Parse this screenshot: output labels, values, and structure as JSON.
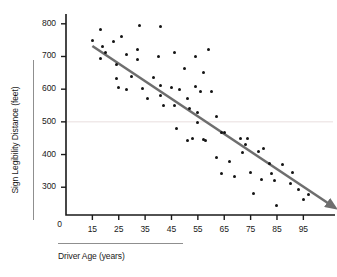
{
  "chart_data": {
    "type": "scatter",
    "title": "",
    "xlabel": "Driver Age (years)",
    "ylabel": "Sign Legibility Distance (feet)",
    "xlim": [
      5,
      107
    ],
    "ylim": [
      215,
      830
    ],
    "xticks": [
      15,
      25,
      35,
      45,
      55,
      65,
      75,
      85,
      95
    ],
    "yticks": [
      300,
      400,
      500,
      600,
      700,
      800
    ],
    "origin_label": "0",
    "grid": "single faint horizontal gridline at y=500",
    "gridline_value": 500,
    "legend": "none",
    "series": [
      {
        "name": "drivers",
        "marker": "filled circle",
        "color": "#141414",
        "points": [
          [
            15,
            750
          ],
          [
            18,
            782
          ],
          [
            18,
            695
          ],
          [
            19,
            730
          ],
          [
            20,
            712
          ],
          [
            23,
            745
          ],
          [
            24,
            675
          ],
          [
            24,
            632
          ],
          [
            25,
            604
          ],
          [
            26,
            762
          ],
          [
            28,
            705
          ],
          [
            30,
            640
          ],
          [
            32,
            722
          ],
          [
            32,
            691
          ],
          [
            33,
            795
          ],
          [
            36,
            570
          ],
          [
            38,
            635
          ],
          [
            40,
            700
          ],
          [
            41,
            612
          ],
          [
            41,
            580
          ],
          [
            41,
            793
          ],
          [
            42,
            551
          ],
          [
            45,
            604
          ],
          [
            46,
            713
          ],
          [
            47,
            481
          ],
          [
            48,
            600
          ],
          [
            50,
            662
          ],
          [
            51,
            570
          ],
          [
            51,
            444
          ],
          [
            52,
            540
          ],
          [
            53,
            449
          ],
          [
            54,
            700
          ],
          [
            54,
            607
          ],
          [
            55,
            530
          ],
          [
            55,
            499
          ],
          [
            56,
            592
          ],
          [
            57,
            650
          ],
          [
            58,
            443
          ],
          [
            59,
            722
          ],
          [
            60,
            593
          ],
          [
            62,
            515
          ],
          [
            62,
            391
          ],
          [
            64,
            468
          ],
          [
            65,
            466
          ],
          [
            67,
            380
          ],
          [
            69,
            333
          ],
          [
            71,
            448
          ],
          [
            72,
            405
          ],
          [
            73,
            430
          ],
          [
            74,
            449
          ],
          [
            75,
            344
          ],
          [
            76,
            282
          ],
          [
            78,
            408
          ],
          [
            79,
            324
          ],
          [
            80,
            420
          ],
          [
            82,
            373
          ],
          [
            83,
            341
          ],
          [
            84,
            322
          ],
          [
            85,
            245
          ],
          [
            87,
            370
          ],
          [
            90,
            311
          ],
          [
            91,
            345
          ],
          [
            93,
            292
          ],
          [
            95,
            262
          ],
          [
            97,
            278
          ],
          [
            64,
            343
          ],
          [
            46,
            550
          ],
          [
            34,
            602
          ],
          [
            28,
            600
          ],
          [
            57,
            446
          ]
        ]
      }
    ],
    "trendline": {
      "description": "downward sloping regression arrow",
      "color": "#6e6e6e",
      "start": [
        15,
        732
      ],
      "end": [
        105,
        248
      ],
      "arrowhead": true
    }
  }
}
